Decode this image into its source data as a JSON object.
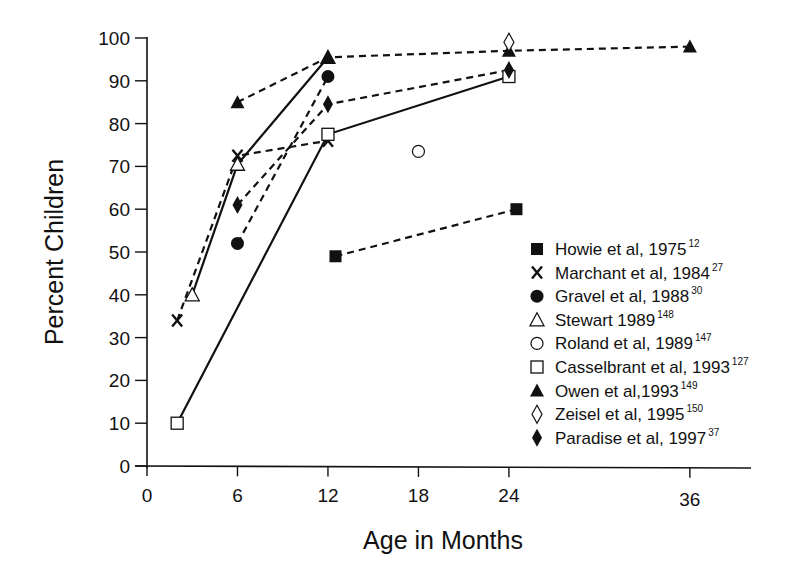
{
  "chart_data": {
    "type": "line",
    "title": "",
    "xlabel": "Age in Months",
    "ylabel": "Percent Children",
    "xlim": [
      0,
      40
    ],
    "ylim": [
      0,
      100
    ],
    "x_ticks": [
      0,
      6,
      12,
      18,
      24,
      36
    ],
    "y_ticks": [
      0,
      10,
      20,
      30,
      40,
      50,
      60,
      70,
      80,
      90,
      100
    ],
    "grid": false,
    "legend_position": "lower right (inside plot)",
    "series": [
      {
        "name": "Howie et al, 1975",
        "ref": "12",
        "marker": "filled-square",
        "line": "dashed",
        "points": [
          [
            12.5,
            49
          ],
          [
            24.5,
            60
          ]
        ]
      },
      {
        "name": "Marchant et al, 1984",
        "ref": "27",
        "marker": "x",
        "line": "dashed",
        "points": [
          [
            2,
            34
          ],
          [
            6,
            72.5
          ],
          [
            12,
            76
          ]
        ]
      },
      {
        "name": "Gravel et al, 1988",
        "ref": "30",
        "marker": "filled-circle",
        "line": "dashed",
        "points": [
          [
            6,
            52
          ],
          [
            12,
            91
          ]
        ]
      },
      {
        "name": "Stewart 1989",
        "ref": "148",
        "marker": "open-triangle",
        "line": "solid",
        "points": [
          [
            3,
            40
          ],
          [
            6,
            70.5
          ],
          [
            12,
            95.5
          ]
        ]
      },
      {
        "name": "Roland et al, 1989",
        "ref": "147",
        "marker": "open-circle",
        "line": "none",
        "points": [
          [
            18,
            73.5
          ]
        ]
      },
      {
        "name": "Casselbrant et al, 1993",
        "ref": "127",
        "marker": "open-square",
        "line": "solid",
        "points": [
          [
            2,
            10
          ],
          [
            12,
            77.5
          ],
          [
            24,
            91
          ]
        ]
      },
      {
        "name": "Owen et al,1993",
        "ref": "149",
        "marker": "filled-triangle",
        "line": "dashed",
        "points": [
          [
            6,
            85
          ],
          [
            12,
            95.5
          ],
          [
            24,
            97
          ],
          [
            36,
            98
          ]
        ]
      },
      {
        "name": "Zeisel et al, 1995",
        "ref": "150",
        "marker": "open-diamond",
        "line": "none",
        "points": [
          [
            24,
            99
          ]
        ]
      },
      {
        "name": "Paradise et al, 1997",
        "ref": "37",
        "marker": "filled-diamond",
        "line": "dashed",
        "points": [
          [
            6,
            61
          ],
          [
            12,
            84.5
          ],
          [
            24,
            92.5
          ]
        ]
      }
    ]
  },
  "legend": {
    "items": [
      {
        "label": "Howie et al, 1975",
        "sup": "12",
        "marker": "filled-square"
      },
      {
        "label": "Marchant et al, 1984",
        "sup": "27",
        "marker": "x"
      },
      {
        "label": "Gravel et al, 1988",
        "sup": "30",
        "marker": "filled-circle"
      },
      {
        "label": "Stewart 1989",
        "sup": "148",
        "marker": "open-triangle"
      },
      {
        "label": "Roland et al, 1989",
        "sup": "147",
        "marker": "open-circle"
      },
      {
        "label": "Casselbrant et al, 1993",
        "sup": "127",
        "marker": "open-square"
      },
      {
        "label": "Owen et al,1993",
        "sup": "149",
        "marker": "filled-triangle"
      },
      {
        "label": "Zeisel et al, 1995",
        "sup": "150",
        "marker": "open-diamond"
      },
      {
        "label": "Paradise et al, 1997",
        "sup": "37",
        "marker": "filled-diamond"
      }
    ]
  },
  "axes": {
    "x_title": "Age in Months",
    "y_title": "Percent Children"
  },
  "colors": {
    "ink": "#111111",
    "background": "#ffffff"
  }
}
